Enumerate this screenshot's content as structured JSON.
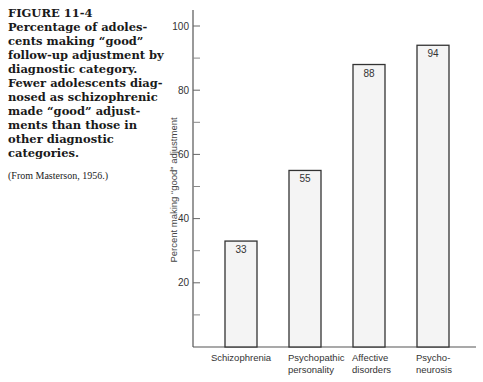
{
  "caption": {
    "figure_label": "FIGURE 11-4",
    "text": "Percentage of adoles-cents making “good” follow-up adjustment by diagnostic category. Fewer adolescents diag-nosed as schizophrenic made “good” adjust-ments than those in other diagnostic categories.",
    "lines": [
      "Percentage of adoles-",
      "cents making “good”",
      "follow-up adjustment by",
      "diagnostic category.",
      "Fewer adolescents diag-",
      "nosed as schizophrenic",
      "made “good” adjust-",
      "ments than those in",
      "other diagnostic",
      "categories."
    ],
    "source": "(From Masterson, 1956.)"
  },
  "chart_data": {
    "type": "bar",
    "xlabel": "",
    "ylabel": "Percent making “good” adjustment",
    "categories": [
      "Schizophrenia",
      "Psychopathic personality",
      "Affective disorders",
      "Psycho-neurosis"
    ],
    "category_lines": [
      [
        "Schizophrenia"
      ],
      [
        "Psychopathic",
        "personality"
      ],
      [
        "Affective",
        "disorders"
      ],
      [
        "Psycho-",
        "neurosis"
      ]
    ],
    "values": [
      33,
      55,
      88,
      94
    ],
    "value_labels": [
      "33",
      "55",
      "88",
      "94"
    ],
    "ylim": [
      0,
      100
    ],
    "yticks_labeled": [
      20,
      40,
      60,
      80,
      100
    ],
    "yticks_minor": [
      10,
      30,
      50,
      70,
      90
    ],
    "grid": false,
    "legend": null,
    "bar_fill": "#f4f4f4",
    "bar_stroke": "#333333"
  }
}
